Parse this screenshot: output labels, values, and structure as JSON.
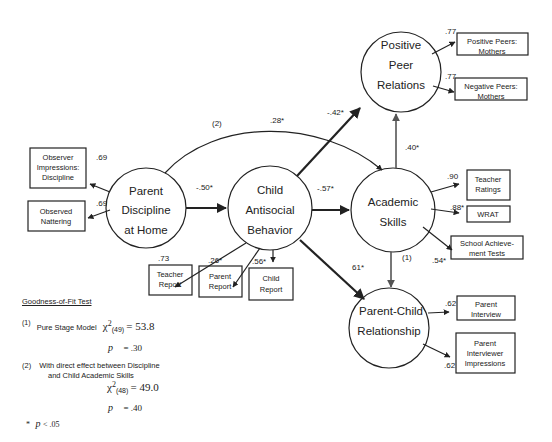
{
  "diagram": {
    "type": "structural-equation-model",
    "latent_nodes": [
      {
        "id": "discipline",
        "lines": [
          "Parent",
          "Discipline",
          "at Home"
        ]
      },
      {
        "id": "antisocial",
        "lines": [
          "Child",
          "Antisocial",
          "Behavior"
        ]
      },
      {
        "id": "academic",
        "lines": [
          "Academic",
          "Skills"
        ]
      },
      {
        "id": "peer",
        "lines": [
          "Positive",
          "Peer",
          "Relations"
        ]
      },
      {
        "id": "parentchild",
        "lines": [
          "Parent-Child",
          "Relationship"
        ]
      }
    ],
    "indicators": {
      "observer_impressions": {
        "lines": [
          "Observer",
          "Impressions:",
          "Discipline"
        ],
        "loading": ".69"
      },
      "observed_nattering": {
        "lines": [
          "Observed",
          "Nattering"
        ],
        "loading": ".69"
      },
      "teacher_report": {
        "lines": [
          "Teacher",
          "Report"
        ],
        "loading": ".73"
      },
      "parent_report": {
        "lines": [
          "Parent",
          "Report"
        ],
        "loading": ".26*"
      },
      "child_report": {
        "lines": [
          "Child",
          "Report"
        ],
        "loading": ".56*"
      },
      "teacher_ratings": {
        "lines": [
          "Teacher",
          "Ratings"
        ],
        "loading": ".90"
      },
      "wrat": {
        "lines": [
          "WRAT"
        ],
        "loading": ".88*"
      },
      "school_achievement": {
        "lines": [
          "School Achieve-",
          "ment Tests"
        ],
        "loading": ".54*"
      },
      "positive_peers": {
        "lines": [
          "Positive Peers:",
          "Mothers"
        ],
        "loading": ".77"
      },
      "negative_peers": {
        "lines": [
          "Negative Peers:",
          "Mothers"
        ],
        "loading": ".77"
      },
      "parent_interview": {
        "lines": [
          "Parent",
          "Interview"
        ],
        "loading": ".62"
      },
      "parent_interviewer": {
        "lines": [
          "Parent",
          "Interviewer",
          "Impressions"
        ],
        "loading": ".62"
      }
    },
    "paths": {
      "discipline_to_antisocial": "-.50*",
      "antisocial_to_academic": "-.57*",
      "antisocial_to_peer": "-.42*",
      "antisocial_to_parentchild": "61*",
      "academic_to_peer": ".40*",
      "academic_to_parentchild_label": "(1)",
      "discipline_to_academic_label": "(2)",
      "discipline_to_academic": ".28*"
    }
  },
  "fit": {
    "title": "Goodness-of-Fit Test",
    "model1": {
      "num": "(1)",
      "label": "Pure Stage Model",
      "chi": "χ",
      "sup": "2",
      "df": "(49)",
      "value": "= 53.8",
      "p_label": "p",
      "p_value": "= .30"
    },
    "model2": {
      "num": "(2)",
      "label_line1": "With direct effect between Discipline",
      "label_line2": "and Child Academic Skills",
      "chi": "χ",
      "sup": "2",
      "df": "(48)",
      "value": "= 49.0",
      "p_label": "p",
      "p_value": "= .40"
    },
    "footnote_star": "*",
    "footnote_p": "p",
    "footnote_text": "< .05"
  }
}
